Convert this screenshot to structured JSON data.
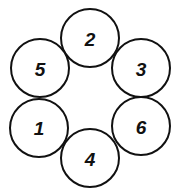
{
  "diagram": {
    "type": "ring-of-circles",
    "stroke_color": "#111111",
    "background": "#ffffff",
    "nodes": [
      {
        "label": "2",
        "cx": 90,
        "cy": 38,
        "r": 29
      },
      {
        "label": "5",
        "cx": 40,
        "cy": 68,
        "r": 29
      },
      {
        "label": "3",
        "cx": 141,
        "cy": 68,
        "r": 29
      },
      {
        "label": "1",
        "cx": 39,
        "cy": 128,
        "r": 29
      },
      {
        "label": "6",
        "cx": 141,
        "cy": 126,
        "r": 29
      },
      {
        "label": "4",
        "cx": 90,
        "cy": 158,
        "r": 29
      }
    ]
  }
}
